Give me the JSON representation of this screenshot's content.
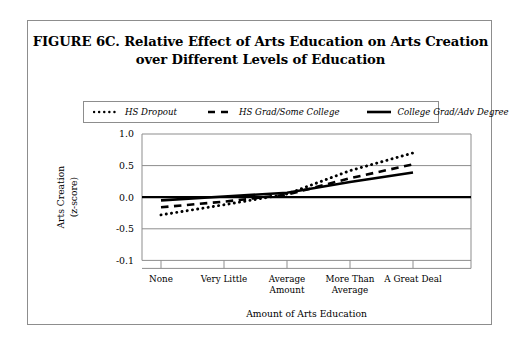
{
  "figure": {
    "title_lines": [
      "FIGURE 6C.  Relative Effect of Arts Education on Arts Creation",
      "over Different Levels of Education"
    ],
    "title_full": "FIGURE 6C.  Relative Effect of Arts Education on Arts Creation over Different Levels of Education"
  },
  "chart_data": {
    "type": "line",
    "title": "FIGURE 6C.  Relative Effect of Arts Education on Arts Creation over Different Levels of Education",
    "xlabel": "Amount of Arts Education",
    "ylabel": "Arts Creation (z-score)",
    "ylabel_lines": [
      "Arts Creation",
      "(z-score)"
    ],
    "categories": [
      "None",
      "Very Little",
      "Average Amount",
      "More Than Average",
      "A Great Deal"
    ],
    "category_lines": [
      [
        "None"
      ],
      [
        "Very Little"
      ],
      [
        "Average",
        "Amount"
      ],
      [
        "More Than",
        "Average"
      ],
      [
        "A Great Deal"
      ]
    ],
    "ytick_labels": [
      "1.0",
      "0.5",
      "0.0",
      "-0.5",
      "-0.1"
    ],
    "ytick_values": [
      1.0,
      0.5,
      0.0,
      -0.5,
      -1.0
    ],
    "ylim": [
      -1.0,
      1.0
    ],
    "grid": true,
    "legend_position": "top",
    "zero_line": true,
    "series": [
      {
        "name": "HS Dropout",
        "style": "dotted",
        "color": "#000000",
        "values": [
          -0.28,
          -0.12,
          0.05,
          0.42,
          0.7
        ]
      },
      {
        "name": "HS Grad/Some College",
        "style": "dashed",
        "color": "#000000",
        "values": [
          -0.16,
          -0.07,
          0.04,
          0.3,
          0.52
        ]
      },
      {
        "name": "College Grad/Adv Degree",
        "style": "solid",
        "color": "#000000",
        "values": [
          -0.05,
          0.01,
          0.07,
          0.24,
          0.39
        ]
      }
    ]
  },
  "colors": {
    "line": "#000000",
    "grid": "#8d8d8d",
    "border": "#8d8d8d",
    "background": "#ffffff"
  }
}
